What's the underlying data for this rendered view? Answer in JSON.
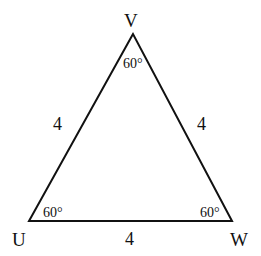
{
  "diagram": {
    "type": "equilateral-triangle",
    "vertices": [
      {
        "name": "V",
        "x": 133,
        "y": 34
      },
      {
        "name": "U",
        "x": 29,
        "y": 221
      },
      {
        "name": "W",
        "x": 232,
        "y": 221
      }
    ],
    "labels": {
      "vertex_v": "V",
      "vertex_u": "U",
      "vertex_w": "W",
      "side_uv": "4",
      "side_vw": "4",
      "side_uw": "4",
      "angle_v": "60°",
      "angle_u": "60°",
      "angle_w": "60°"
    },
    "stroke_color": "#111111"
  }
}
